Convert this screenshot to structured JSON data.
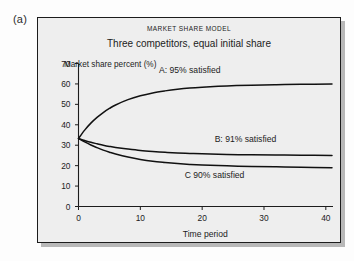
{
  "figure": {
    "label": "(a)"
  },
  "chart_data": {
    "type": "line",
    "title": "MARKET SHARE MODEL",
    "subtitle": "Three competitors, equal initial share",
    "xlabel": "Time period",
    "ylabel": "Market share percent (%)",
    "xlim": [
      0,
      41
    ],
    "ylim": [
      0,
      70
    ],
    "xticks": [
      "0",
      "10",
      "20",
      "30",
      "40"
    ],
    "xtick_values": [
      0,
      10,
      20,
      30,
      40
    ],
    "yticks": [
      "0",
      "10",
      "20",
      "30",
      "40",
      "50",
      "60",
      "70"
    ],
    "ytick_values": [
      0,
      10,
      20,
      30,
      40,
      50,
      60,
      70
    ],
    "grid": false,
    "legend": "annotations-inline",
    "x": [
      0,
      1,
      2,
      3,
      4,
      5,
      6,
      8,
      10,
      12,
      14,
      16,
      18,
      20,
      24,
      28,
      32,
      36,
      41
    ],
    "series": [
      {
        "name": "A: 95% satisfied",
        "annotation": "A: 95% satisfied",
        "satisfied_percent": 95,
        "initial": 33.3,
        "asymptote": 60,
        "values": [
          33.3,
          37.4,
          40.8,
          43.6,
          46.0,
          48.0,
          49.7,
          52.3,
          54.2,
          55.6,
          56.6,
          57.4,
          58.0,
          58.4,
          59.0,
          59.4,
          59.6,
          59.8,
          60.0
        ]
      },
      {
        "name": "B: 91% satisfied",
        "annotation": "B: 91% satisfied",
        "satisfied_percent": 91,
        "initial": 33.3,
        "asymptote": 25,
        "values": [
          33.3,
          32.3,
          31.4,
          30.7,
          30.0,
          29.4,
          28.9,
          28.1,
          27.4,
          26.9,
          26.5,
          26.2,
          26.0,
          25.8,
          25.5,
          25.3,
          25.2,
          25.1,
          25.0
        ]
      },
      {
        "name": "C 90% satisfied",
        "annotation": "C 90% satisfied",
        "satisfied_percent": 90,
        "initial": 33.3,
        "asymptote": 19,
        "values": [
          33.3,
          31.6,
          30.1,
          28.8,
          27.6,
          26.6,
          25.7,
          24.2,
          23.0,
          22.1,
          21.5,
          21.0,
          20.6,
          20.3,
          19.9,
          19.6,
          19.4,
          19.2,
          19.0
        ]
      }
    ],
    "annotations": [
      {
        "text": "A: 95% satisfied",
        "x": 18.0,
        "y": 65.5
      },
      {
        "text": "B: 91% satisfied",
        "x": 27.0,
        "y": 31.5
      },
      {
        "text": "C 90% satisfied",
        "x": 22.0,
        "y": 13.8
      }
    ],
    "colors": {
      "line": "#111111",
      "axis": "#1c1c1c",
      "panel_background": "#eeeeee",
      "frame_border": "#1c1c1c"
    }
  }
}
